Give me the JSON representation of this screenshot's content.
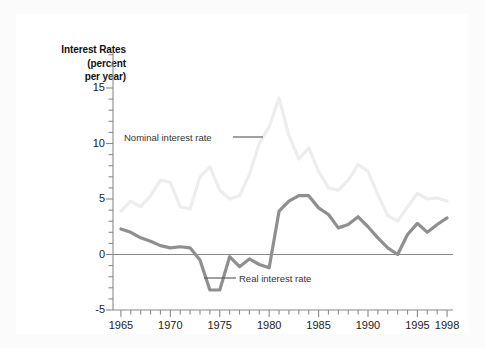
{
  "figure": {
    "background_color": "#fbfbfb",
    "plot_background_color": "#ffffff"
  },
  "chart_data": {
    "type": "line",
    "title": "",
    "axis_title_lines": [
      "Interest Rates",
      "(percent",
      "per year)"
    ],
    "xlabel": "",
    "ylabel": "Interest Rates (percent per year)",
    "xlim": [
      1964.2,
      1998.6
    ],
    "ylim": [
      -5,
      16.4
    ],
    "yticks": [
      -5,
      0,
      5,
      10,
      15
    ],
    "ytick_labels": [
      "-5",
      "0",
      "5",
      "10",
      "15"
    ],
    "yminor_step": 1,
    "xticks": [
      1965,
      1970,
      1975,
      1980,
      1985,
      1990,
      1995,
      1998
    ],
    "xtick_labels": [
      "1965",
      "1970",
      "1975",
      "1980",
      "1985",
      "1990",
      "1995",
      "1998"
    ],
    "xminor_step": 1,
    "grid": false,
    "legend_position": "inline-annotations",
    "zero_baseline": true,
    "zero_baseline_color": "#8a8a8a",
    "axis_color": "#8a8a8a",
    "x": [
      1965,
      1966,
      1967,
      1968,
      1969,
      1970,
      1971,
      1972,
      1973,
      1974,
      1975,
      1976,
      1977,
      1978,
      1979,
      1980,
      1981,
      1982,
      1983,
      1984,
      1985,
      1986,
      1987,
      1988,
      1989,
      1990,
      1991,
      1992,
      1993,
      1994,
      1995,
      1996,
      1997,
      1998
    ],
    "series": [
      {
        "name": "Nominal interest rate",
        "color": "#ededed",
        "line_width": 3.2,
        "label": "Nominal interest rate",
        "values": [
          3.9,
          4.8,
          4.3,
          5.3,
          6.7,
          6.5,
          4.3,
          4.1,
          7.0,
          7.9,
          5.8,
          5.0,
          5.3,
          7.2,
          10.0,
          11.5,
          14.1,
          10.7,
          8.6,
          9.6,
          7.5,
          6.0,
          5.8,
          6.7,
          8.1,
          7.5,
          5.4,
          3.5,
          3.0,
          4.3,
          5.5,
          5.0,
          5.1,
          4.8
        ]
      },
      {
        "name": "Real interest rate",
        "color": "#8f8f8f",
        "line_width": 3.2,
        "label": "Real interest rate",
        "values": [
          2.3,
          2.0,
          1.5,
          1.2,
          0.8,
          0.6,
          0.7,
          0.6,
          -0.5,
          -3.2,
          -3.2,
          -0.2,
          -1.1,
          -0.4,
          -0.9,
          -1.2,
          3.9,
          4.8,
          5.3,
          5.3,
          4.2,
          3.6,
          2.4,
          2.7,
          3.4,
          2.5,
          1.5,
          0.6,
          0.0,
          1.8,
          2.8,
          2.0,
          2.7,
          3.3
        ]
      }
    ],
    "annotations": [
      {
        "name": "nominal-interest-rate-label",
        "text": "Nominal interest rate",
        "x_px": 124,
        "y_px": 132,
        "leader": {
          "x1": 233,
          "y1": 137,
          "x2": 263,
          "y2": 137
        }
      },
      {
        "name": "real-interest-rate-label",
        "text": "Real interest rate",
        "x_px": 239,
        "y_px": 273,
        "leader": {
          "x1": 204,
          "y1": 278,
          "x2": 236,
          "y2": 278
        }
      }
    ]
  }
}
